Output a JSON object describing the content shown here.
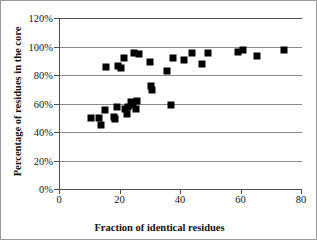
{
  "chart_data": {
    "type": "scatter",
    "title": "",
    "xlabel": "Fraction of identical residues",
    "ylabel": "Percentage of residues in the core",
    "xlim": [
      0,
      80
    ],
    "ylim": [
      0,
      120
    ],
    "xticks": [
      0,
      20,
      40,
      60,
      80
    ],
    "xtick_labels": [
      "0",
      "20",
      "40",
      "60",
      "80"
    ],
    "yticks": [
      0,
      20,
      40,
      60,
      80,
      100,
      120
    ],
    "ytick_labels": [
      "0%",
      "20%",
      "40%",
      "60%",
      "80%",
      "100%",
      "120%"
    ],
    "grid": "horizontal",
    "legend": null,
    "marker": "filled-square",
    "marker_color": "#000000",
    "series": [
      {
        "name": "proteins",
        "points": [
          [
            10.3,
            49.8
          ],
          [
            13.0,
            50.0
          ],
          [
            13.5,
            45.0
          ],
          [
            15.0,
            55.5
          ],
          [
            15.2,
            85.3
          ],
          [
            17.8,
            50.5
          ],
          [
            18.1,
            49.3
          ],
          [
            19.0,
            57.5
          ],
          [
            19.3,
            86.0
          ],
          [
            20.1,
            85.2
          ],
          [
            21.0,
            91.8
          ],
          [
            21.6,
            56.3
          ],
          [
            22.0,
            52.5
          ],
          [
            22.6,
            57.2
          ],
          [
            23.4,
            61.0
          ],
          [
            24.1,
            59.0
          ],
          [
            24.6,
            95.5
          ],
          [
            25.0,
            55.8
          ],
          [
            25.4,
            61.8
          ],
          [
            26.2,
            94.8
          ],
          [
            29.6,
            89.2
          ],
          [
            30.0,
            72.3
          ],
          [
            30.3,
            69.8
          ],
          [
            35.4,
            82.8
          ],
          [
            36.6,
            58.8
          ],
          [
            37.2,
            91.8
          ],
          [
            41.0,
            90.5
          ],
          [
            43.8,
            95.5
          ],
          [
            47.0,
            88.0
          ],
          [
            48.8,
            95.5
          ],
          [
            59.0,
            96.3
          ],
          [
            60.5,
            97.8
          ],
          [
            65.0,
            93.5
          ],
          [
            74.0,
            97.3
          ]
        ]
      }
    ]
  }
}
